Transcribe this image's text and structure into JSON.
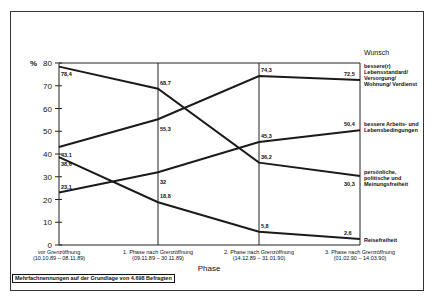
{
  "chart_data": {
    "type": "line",
    "title": "",
    "xlabel": "Phase",
    "ylabel": "%",
    "ylim": [
      0,
      80
    ],
    "yticks": [
      0,
      10,
      20,
      30,
      40,
      50,
      60,
      70,
      80
    ],
    "categories": [
      "vor Grenzöffnung (10.10.89 – 08.11.89)",
      "1. Phase nach Grenzöffnung (09.11.89 – 30.11.89)",
      "2. Phase nach Grenzöffnung (14.12.89 – 31.01.90)",
      "3. Phase nach Grenzöffnung (01.02.90 – 14.03.90)"
    ],
    "legend_title": "Wunsch",
    "series": [
      {
        "name": "bessere(r) Lebensstandard/ Versorgung/ Wohnung/ Verdienst",
        "values": [
          43.1,
          55.3,
          74.3,
          72.5
        ]
      },
      {
        "name": "bessere Arbeits- und Lebensbedingungen",
        "values": [
          23.1,
          32,
          45.3,
          50.4
        ]
      },
      {
        "name": "persönliche, politische und Meinungsfreiheit",
        "values": [
          78.4,
          68.7,
          36.2,
          30.3
        ]
      },
      {
        "name": "Reisefreiheit",
        "values": [
          38.6,
          18.8,
          5.8,
          2.6
        ]
      }
    ],
    "value_labels": [
      [
        "43,1",
        "55,3",
        "74,3",
        "72,5"
      ],
      [
        "23,1",
        "32",
        "45,3",
        "50,4"
      ],
      [
        "78,4",
        "68,7",
        "36,2",
        "30,3"
      ],
      [
        "38,6",
        "18,8",
        "5,8",
        "2,6"
      ]
    ],
    "footnote": "Mehrfachnennungen auf der Grundlage von 4.698 Befragten",
    "grid": false,
    "legend_position": "right"
  },
  "axis": {
    "y_unit": "%",
    "x_title": "Phase",
    "cat0_line1": "vor Grenzöffnung",
    "cat0_line2": "(10.10.89 – 08.11.89)",
    "cat1_line1": "1. Phase nach Grenzöffnung",
    "cat1_line2": "(09.11.89 – 30.11.89)",
    "cat2_line1": "2. Phase nach Grenzöffnung",
    "cat2_line2": "(14.12.89 – 31.01.90)",
    "cat3_line1": "3. Phase nach Grenzöffnung",
    "cat3_line2": "(01.02.90 – 14.03.90)"
  },
  "legend": {
    "title": "Wunsch",
    "s0": "bessere(r) Lebensstandard/ Versorgung/ Wohnung/ Verdienst",
    "s1": "bessere Arbeits- und Lebensbedingungen",
    "s2": "persönliche, politische und Meinungsfreiheit",
    "s3": "Reisefreiheit"
  },
  "footnote": "Mehrfachnennungen auf der Grundlage von 4.698 Befragten"
}
